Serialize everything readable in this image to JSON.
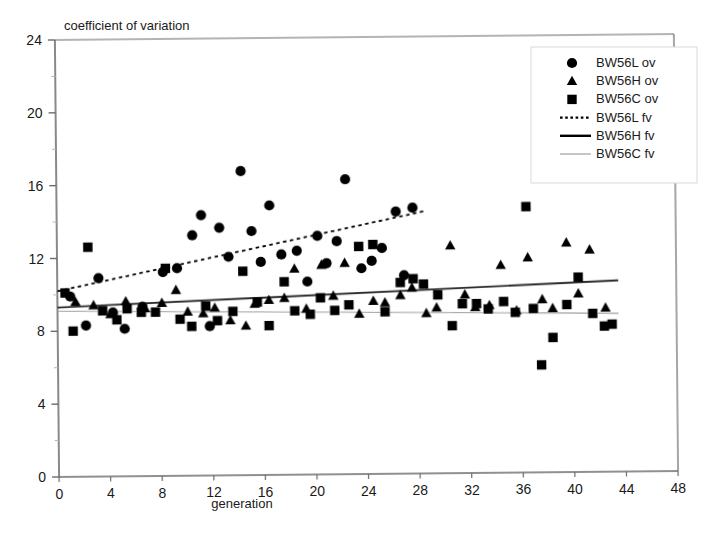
{
  "chart_data": {
    "type": "scatter",
    "title": "",
    "xlabel": "generation",
    "ylabel": "coefficient of variation",
    "xlim": [
      0,
      48
    ],
    "ylim": [
      0,
      24
    ],
    "xticks": [
      0,
      4,
      8,
      12,
      16,
      20,
      24,
      28,
      32,
      36,
      40,
      44,
      48
    ],
    "yticks": [
      0,
      4,
      8,
      12,
      16,
      20,
      24
    ],
    "yminor": [
      2,
      6,
      10,
      14,
      18,
      22
    ],
    "grid": false,
    "legend_position": "top-right",
    "series": [
      {
        "name": "BW56L ov",
        "marker": "circle",
        "color": "#000000",
        "points": [
          [
            1.0,
            9.9
          ],
          [
            2.2,
            8.3
          ],
          [
            3.2,
            10.9
          ],
          [
            4.3,
            9.0
          ],
          [
            5.2,
            8.1
          ],
          [
            6.6,
            9.3
          ],
          [
            8.2,
            11.2
          ],
          [
            9.3,
            11.4
          ],
          [
            10.5,
            13.2
          ],
          [
            11.2,
            14.3
          ],
          [
            11.8,
            8.2
          ],
          [
            12.6,
            13.6
          ],
          [
            13.3,
            12.0
          ],
          [
            14.3,
            16.7
          ],
          [
            15.1,
            13.4
          ],
          [
            15.8,
            11.7
          ],
          [
            16.5,
            14.8
          ],
          [
            17.4,
            12.1
          ],
          [
            18.6,
            12.3
          ],
          [
            19.4,
            10.6
          ],
          [
            20.2,
            13.1
          ],
          [
            20.9,
            11.6
          ],
          [
            21.7,
            12.8
          ],
          [
            22.4,
            16.2
          ],
          [
            23.6,
            11.3
          ],
          [
            24.4,
            11.7
          ],
          [
            25.2,
            12.4
          ],
          [
            26.3,
            14.4
          ],
          [
            26.9,
            10.9
          ],
          [
            27.6,
            14.6
          ]
        ]
      },
      {
        "name": "BW56H ov",
        "marker": "triangle",
        "color": "#000000",
        "points": [
          [
            1.4,
            9.6
          ],
          [
            2.8,
            9.4
          ],
          [
            4.1,
            8.9
          ],
          [
            5.3,
            9.6
          ],
          [
            6.8,
            9.2
          ],
          [
            8.1,
            9.5
          ],
          [
            9.2,
            10.2
          ],
          [
            10.1,
            9.0
          ],
          [
            11.3,
            8.9
          ],
          [
            12.2,
            9.2
          ],
          [
            13.4,
            8.5
          ],
          [
            14.6,
            8.2
          ],
          [
            15.3,
            9.4
          ],
          [
            16.4,
            9.6
          ],
          [
            17.6,
            9.7
          ],
          [
            18.4,
            11.3
          ],
          [
            19.3,
            9.1
          ],
          [
            20.5,
            11.5
          ],
          [
            21.4,
            9.8
          ],
          [
            22.3,
            11.6
          ],
          [
            23.4,
            8.8
          ],
          [
            24.5,
            9.5
          ],
          [
            25.4,
            9.4
          ],
          [
            26.6,
            9.8
          ],
          [
            27.5,
            10.2
          ],
          [
            28.6,
            8.8
          ],
          [
            29.4,
            9.1
          ],
          [
            30.5,
            12.5
          ],
          [
            31.6,
            9.8
          ],
          [
            32.4,
            9.1
          ],
          [
            33.5,
            9.2
          ],
          [
            34.4,
            11.4
          ],
          [
            35.6,
            8.9
          ],
          [
            36.5,
            11.8
          ],
          [
            37.6,
            9.5
          ],
          [
            38.4,
            9.0
          ],
          [
            39.5,
            12.6
          ],
          [
            40.4,
            9.8
          ],
          [
            41.3,
            12.2
          ],
          [
            42.5,
            9.0
          ]
        ]
      },
      {
        "name": "BW56C ov",
        "marker": "square",
        "color": "#000000",
        "points": [
          [
            0.6,
            10.1
          ],
          [
            1.2,
            8.0
          ],
          [
            2.4,
            12.6
          ],
          [
            3.5,
            9.1
          ],
          [
            4.6,
            8.6
          ],
          [
            5.4,
            9.2
          ],
          [
            6.5,
            9.0
          ],
          [
            7.6,
            9.0
          ],
          [
            8.4,
            11.4
          ],
          [
            9.5,
            8.6
          ],
          [
            10.4,
            8.2
          ],
          [
            11.5,
            9.3
          ],
          [
            12.4,
            8.5
          ],
          [
            13.6,
            9.0
          ],
          [
            14.4,
            11.2
          ],
          [
            15.5,
            9.5
          ],
          [
            16.4,
            8.2
          ],
          [
            17.6,
            10.6
          ],
          [
            18.4,
            9.0
          ],
          [
            19.6,
            8.8
          ],
          [
            20.4,
            9.7
          ],
          [
            21.5,
            9.0
          ],
          [
            22.6,
            9.3
          ],
          [
            23.4,
            12.5
          ],
          [
            24.5,
            12.6
          ],
          [
            25.4,
            8.9
          ],
          [
            26.6,
            10.5
          ],
          [
            27.6,
            10.7
          ],
          [
            28.4,
            10.4
          ],
          [
            29.5,
            9.8
          ],
          [
            30.6,
            8.1
          ],
          [
            31.4,
            9.3
          ],
          [
            32.5,
            9.3
          ],
          [
            33.4,
            9.0
          ],
          [
            34.6,
            9.4
          ],
          [
            35.5,
            8.8
          ],
          [
            36.4,
            14.6
          ],
          [
            36.9,
            9.0
          ],
          [
            37.5,
            5.9
          ],
          [
            38.4,
            7.4
          ],
          [
            39.5,
            9.2
          ],
          [
            40.4,
            10.7
          ],
          [
            41.5,
            8.7
          ],
          [
            42.4,
            8.0
          ],
          [
            43.0,
            8.1
          ]
        ]
      }
    ],
    "trendlines": [
      {
        "name": "BW56L fv",
        "style": "dotted",
        "color": "#000000",
        "x0": 0,
        "y0": 10.2,
        "x1": 28.5,
        "y1": 14.4
      },
      {
        "name": "BW56H fv",
        "style": "solid",
        "color": "#2b2b2b",
        "x0": 0,
        "y0": 9.3,
        "x1": 43.5,
        "y1": 10.5
      },
      {
        "name": "BW56C fv",
        "style": "solid-light",
        "color": "#a0a0a0",
        "x0": 0,
        "y0": 9.1,
        "x1": 43.5,
        "y1": 8.7
      }
    ],
    "legend": [
      {
        "label": "BW56L ov",
        "kind": "marker",
        "marker": "circle",
        "color": "#000000"
      },
      {
        "label": "BW56H ov",
        "kind": "marker",
        "marker": "triangle",
        "color": "#000000"
      },
      {
        "label": "BW56C ov",
        "kind": "marker",
        "marker": "square",
        "color": "#000000"
      },
      {
        "label": "BW56L fv",
        "kind": "line",
        "style": "dotted",
        "color": "#000000"
      },
      {
        "label": "BW56H fv",
        "kind": "line",
        "style": "solid",
        "color": "#000000"
      },
      {
        "label": "BW56C fv",
        "kind": "line",
        "style": "solid-light",
        "color": "#a0a0a0"
      }
    ]
  },
  "axes": {
    "x_title": "generation",
    "y_title": "coefficient of variation",
    "x_tick_labels": [
      "0",
      "4",
      "8",
      "12",
      "16",
      "20",
      "24",
      "28",
      "32",
      "36",
      "40",
      "44",
      "48"
    ],
    "y_tick_labels": [
      "0",
      "4",
      "8",
      "12",
      "16",
      "20",
      "24"
    ]
  },
  "colors": {
    "axis": "#6b6b6b",
    "marker": "#000000",
    "light_line": "#a0a0a0",
    "background": "#ffffff",
    "text": "#1a1a1a"
  }
}
